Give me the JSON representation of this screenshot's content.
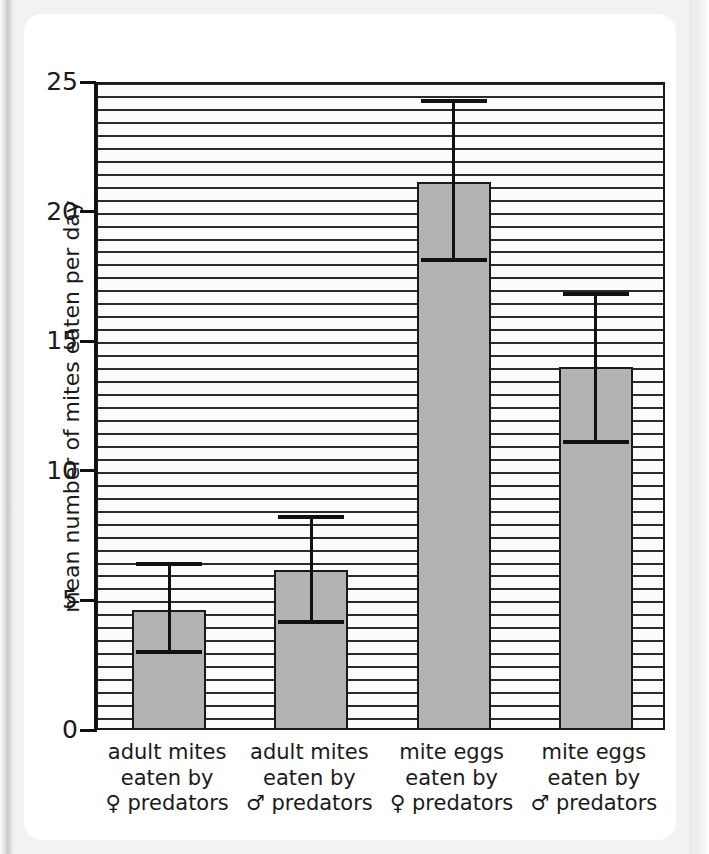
{
  "chart_data": {
    "type": "bar",
    "title": "",
    "xlabel": "",
    "ylabel": "mean number of mites eaten per day",
    "ylim": [
      0,
      25
    ],
    "ytick_labels": [
      "0",
      "5",
      "10",
      "15",
      "20",
      "25"
    ],
    "yticks": [
      0,
      5,
      10,
      15,
      20,
      25
    ],
    "grid": "horizontal gridlines every 0.5 units",
    "legend": "none",
    "categories": [
      "adult mites eaten by ♀ predators",
      "adult mites eaten by ♂ predators",
      "mite eggs eaten by ♀ predators",
      "mite eggs eaten by ♂ predators"
    ],
    "values": [
      4.7,
      6.25,
      21.2,
      14.1
    ],
    "error_low": [
      3.1,
      4.25,
      18.2,
      11.2
    ],
    "error_high": [
      6.5,
      8.3,
      24.35,
      16.9
    ],
    "bar_fill_color": "#b3b3b3",
    "bar_edge_color": "#1a1a1a"
  },
  "axis": {
    "y_title": "mean number of mites eaten per day",
    "ticks": [
      {
        "label": "25",
        "value": 25
      },
      {
        "label": "20",
        "value": 20
      },
      {
        "label": "15",
        "value": 15
      },
      {
        "label": "10",
        "value": 10
      },
      {
        "label": "5",
        "value": 5
      },
      {
        "label": "0",
        "value": 0
      }
    ]
  },
  "x_categories": [
    {
      "line1": "adult mites",
      "line2": "eaten by",
      "symbol": "♀",
      "line3": "predators"
    },
    {
      "line1": "adult mites",
      "line2": "eaten by",
      "symbol": "♂",
      "line3": "predators"
    },
    {
      "line1": "mite eggs",
      "line2": "eaten by",
      "symbol": "♀",
      "line3": "predators"
    },
    {
      "line1": "mite eggs",
      "line2": "eaten by",
      "symbol": "♂",
      "line3": "predators"
    }
  ]
}
